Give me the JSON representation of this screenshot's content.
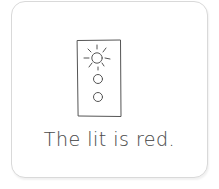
{
  "card": {
    "caption": "The lit is red.",
    "illustration": {
      "subject": "traffic-light",
      "lights": [
        {
          "position": "top",
          "state": "lit"
        },
        {
          "position": "middle",
          "state": "off"
        },
        {
          "position": "bottom",
          "state": "off"
        }
      ]
    }
  },
  "colors": {
    "line": "#555555",
    "border": "#d9d9d9",
    "background": "#ffffff"
  }
}
